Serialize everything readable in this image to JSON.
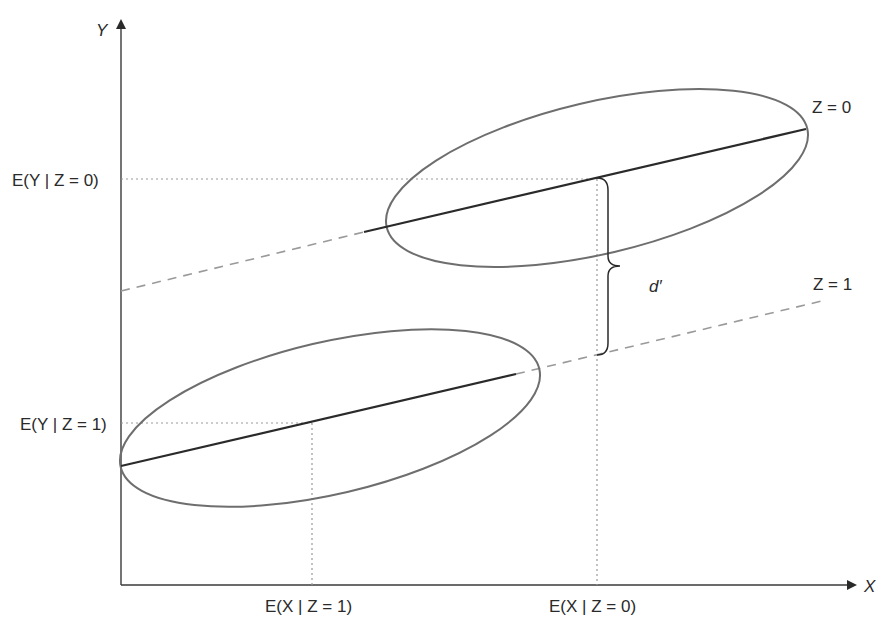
{
  "diagram": {
    "axes": {
      "x_label": "X",
      "y_label": "Y"
    },
    "groups": [
      {
        "name": "Z=0",
        "label": "Z = 0",
        "mean_x_label": "E(X | Z = 0)",
        "mean_y_label": "E(Y | Z = 0)"
      },
      {
        "name": "Z=1",
        "label": "Z = 1",
        "mean_x_label": "E(X | Z = 1)",
        "mean_y_label": "E(Y | Z = 1)"
      }
    ],
    "difference_label": "d′",
    "colors": {
      "axis": "#3a3a3a",
      "ellipse": "#6e6e6e",
      "regression_line": "#2a2a2a",
      "dashed_extension": "#9a9a9a",
      "dotted_guides": "#9a9a9a",
      "text": "#2a2a2a"
    }
  }
}
